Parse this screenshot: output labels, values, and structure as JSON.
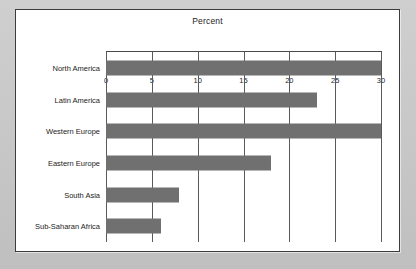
{
  "chart_data": {
    "type": "bar",
    "orientation": "horizontal",
    "title": "Percent",
    "xlabel": "",
    "ylabel": "",
    "categories": [
      "North America",
      "Latin America",
      "Western Europe",
      "Eastern Europe",
      "South Asia",
      "Sub-Saharan Africa"
    ],
    "values": [
      30,
      23,
      30,
      18,
      8,
      6
    ],
    "xlim": [
      0,
      30
    ],
    "xticks": [
      0,
      5,
      10,
      15,
      20,
      25,
      30
    ],
    "xtick_labels": [
      "0",
      "5",
      "10",
      "15",
      "20",
      "25",
      "30"
    ],
    "grid": true,
    "grid_axis": "x",
    "legend": false,
    "bar_color": "#707070",
    "gridline_color": "#5a5a5a",
    "axis_color": "#4a4a4a",
    "panel_background": "#ffffff",
    "page_background": "#c9c9c9",
    "text_color": "#1d1d1d"
  }
}
